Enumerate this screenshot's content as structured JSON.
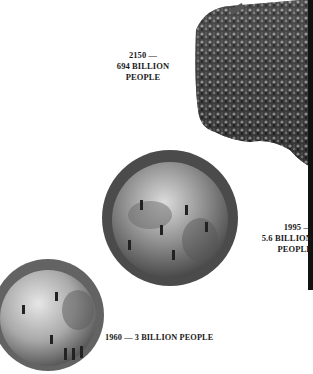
{
  "illustration": {
    "subject": "world population growth shown as increasingly crowded globes",
    "stages": [
      {
        "id": "1960",
        "year": "1960",
        "line1": "1960 — 3 BILLION PEOPLE",
        "population": "3 BILLION PEOPLE"
      },
      {
        "id": "1995",
        "year": "1995 —",
        "line2": "5.6 BILLION",
        "line3": "PEOPLE"
      },
      {
        "id": "2150",
        "year": "2150 —",
        "line2": "694 BILLION",
        "line3": "PEOPLE"
      }
    ],
    "colors": {
      "background": "#ffffff",
      "text": "#1a1a1a",
      "globe_light": "#bdbdbd",
      "globe_dark": "#5a5a5a",
      "crowd_dark": "#2b2b2b",
      "crowd_light": "#8a8a8a"
    }
  }
}
